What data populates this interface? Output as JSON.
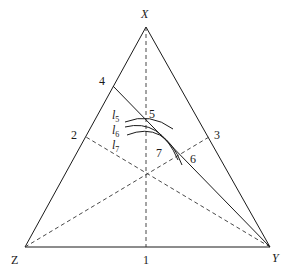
{
  "diagram": {
    "type": "ternary-phase-diagram",
    "vertices": {
      "X": {
        "label": "X",
        "x": 146,
        "y": 27
      },
      "Y": {
        "label": "Y",
        "x": 270,
        "y": 247
      },
      "Z": {
        "label": "Z",
        "x": 25,
        "y": 247
      }
    },
    "points": {
      "p1": {
        "label": "1",
        "x": 146,
        "y": 247
      },
      "p2": {
        "label": "2",
        "x": 86,
        "y": 137
      },
      "p3": {
        "label": "3",
        "x": 209,
        "y": 137
      },
      "p4": {
        "label": "4",
        "x": 113,
        "y": 86
      },
      "p5": {
        "label": "5",
        "x": 146,
        "y": 118
      },
      "p6": {
        "label": "6",
        "x": 181,
        "y": 154
      },
      "p7": {
        "label": "7"
      }
    },
    "curves": [
      {
        "name": "l5",
        "label_main": "l",
        "label_sub": "5"
      },
      {
        "name": "l6",
        "label_main": "l",
        "label_sub": "6"
      },
      {
        "name": "l7",
        "label_main": "l",
        "label_sub": "7"
      }
    ],
    "colors": {
      "line": "#1a1a1a",
      "background": "#ffffff"
    }
  }
}
